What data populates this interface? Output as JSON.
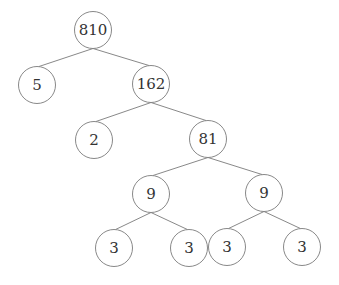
{
  "diagram": {
    "type": "factor-tree",
    "root": "810",
    "nodes": [
      {
        "id": "n810",
        "label": "810",
        "x": 93,
        "y": 30
      },
      {
        "id": "n5",
        "label": "5",
        "x": 37,
        "y": 85
      },
      {
        "id": "n162",
        "label": "162",
        "x": 151,
        "y": 84
      },
      {
        "id": "n2",
        "label": "2",
        "x": 94,
        "y": 140
      },
      {
        "id": "n81",
        "label": "81",
        "x": 208,
        "y": 139
      },
      {
        "id": "n9a",
        "label": "9",
        "x": 151,
        "y": 194
      },
      {
        "id": "n9b",
        "label": "9",
        "x": 264,
        "y": 193
      },
      {
        "id": "n3a",
        "label": "3",
        "x": 114,
        "y": 248
      },
      {
        "id": "n3b",
        "label": "3",
        "x": 189,
        "y": 248
      },
      {
        "id": "n3c",
        "label": "3",
        "x": 227,
        "y": 247
      },
      {
        "id": "n3d",
        "label": "3",
        "x": 302,
        "y": 247
      }
    ],
    "edges": [
      [
        "n810",
        "n5"
      ],
      [
        "n810",
        "n162"
      ],
      [
        "n162",
        "n2"
      ],
      [
        "n162",
        "n81"
      ],
      [
        "n81",
        "n9a"
      ],
      [
        "n81",
        "n9b"
      ],
      [
        "n9a",
        "n3a"
      ],
      [
        "n9a",
        "n3b"
      ],
      [
        "n9b",
        "n3c"
      ],
      [
        "n9b",
        "n3d"
      ]
    ],
    "radius": 18.5,
    "colors": {
      "stroke": "#7a7a7a",
      "text": "#333333",
      "background": "#ffffff"
    }
  }
}
